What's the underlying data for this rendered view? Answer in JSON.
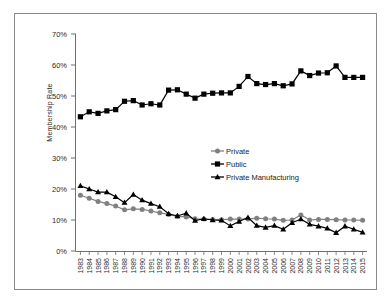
{
  "chart_data": {
    "type": "line",
    "title": "",
    "xlabel": "",
    "ylabel": "Membership Rate",
    "ylim": [
      0,
      70
    ],
    "ytick_labels": [
      "0%",
      "10%",
      "20%",
      "30%",
      "40%",
      "50%",
      "60%",
      "70%"
    ],
    "ytick_values": [
      0,
      10,
      20,
      30,
      40,
      50,
      60,
      70
    ],
    "grid": false,
    "legend_position": "center-right",
    "categories": [
      "1983",
      "1984",
      "1985",
      "1986",
      "1987",
      "1988",
      "1989",
      "1990",
      "1991",
      "1992",
      "1993",
      "1994",
      "1995",
      "1996",
      "1997",
      "1998",
      "1999",
      "2000",
      "2001",
      "2002",
      "2003",
      "2004",
      "2005",
      "2006",
      "2007",
      "2008",
      "2009",
      "2010",
      "2011",
      "2012",
      "2013",
      "2014",
      "2015"
    ],
    "series": [
      {
        "name": "Private",
        "marker": "circle",
        "color": "#808080",
        "values": [
          18.0,
          17.0,
          16.0,
          15.3,
          14.5,
          13.3,
          13.6,
          13.4,
          12.9,
          12.3,
          11.8,
          11.2,
          11.0,
          10.4,
          10.3,
          10.2,
          10.1,
          10.3,
          10.3,
          10.3,
          10.6,
          10.4,
          10.3,
          9.9,
          10.0,
          11.6,
          10.0,
          10.2,
          10.2,
          10.1,
          10.0,
          10.0,
          9.9
        ]
      },
      {
        "name": "Public",
        "marker": "square",
        "color": "#000000",
        "values": [
          43.3,
          44.9,
          44.4,
          45.2,
          45.6,
          48.3,
          48.5,
          47.1,
          47.5,
          47.1,
          51.9,
          52.0,
          50.6,
          49.3,
          50.6,
          50.9,
          51.0,
          51.0,
          53.1,
          56.3,
          54.0,
          53.7,
          54.0,
          53.3,
          53.9,
          58.1,
          56.6,
          57.4,
          57.5,
          59.7,
          56.0,
          56.0,
          56.0
        ]
      },
      {
        "name": "Private Manufacturing",
        "marker": "triangle",
        "color": "#000000",
        "values": [
          21.0,
          20.0,
          19.0,
          19.0,
          17.5,
          15.6,
          18.2,
          16.4,
          15.3,
          14.3,
          12.0,
          11.3,
          12.2,
          9.8,
          10.4,
          10.0,
          9.9,
          8.1,
          9.5,
          10.8,
          8.2,
          7.6,
          8.2,
          7.0,
          9.1,
          10.3,
          8.6,
          8.0,
          7.3,
          5.9,
          8.0,
          7.0,
          6.0
        ]
      }
    ]
  }
}
